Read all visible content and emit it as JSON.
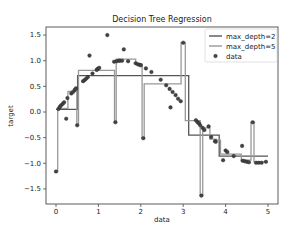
{
  "chart_data": {
    "type": "line",
    "title": "Decision Tree Regression",
    "xlabel": "data",
    "ylabel": "target",
    "xlim": [
      -0.25,
      5.2
    ],
    "ylim": [
      -1.8,
      1.62
    ],
    "xticks": [
      0,
      1,
      2,
      3,
      4,
      5
    ],
    "yticks": [
      -1.5,
      -1.0,
      -0.5,
      0.0,
      0.5,
      1.0,
      1.5
    ],
    "xtick_labels": [
      "0",
      "1",
      "2",
      "3",
      "4",
      "5"
    ],
    "ytick_labels": [
      "−1.5",
      "−1.0",
      "−0.5",
      "0.0",
      "0.5",
      "1.0",
      "1.5"
    ],
    "grid": false,
    "legend_position": "upper right",
    "legend": [
      "max_depth=2",
      "max_depth=5",
      "data"
    ],
    "series": [
      {
        "name": "max_depth=2",
        "kind": "step",
        "color": "#555555",
        "points": [
          [
            0.0,
            0.05
          ],
          [
            0.51,
            0.05
          ],
          [
            0.51,
            0.71
          ],
          [
            3.13,
            0.71
          ],
          [
            3.13,
            -0.45
          ],
          [
            3.85,
            -0.45
          ],
          [
            3.85,
            -0.86
          ],
          [
            5.0,
            -0.86
          ]
        ]
      },
      {
        "name": "max_depth=5",
        "kind": "step",
        "color": "#999999",
        "points": [
          [
            0.0,
            -1.16
          ],
          [
            0.04,
            -1.16
          ],
          [
            0.04,
            0.07
          ],
          [
            0.28,
            0.07
          ],
          [
            0.28,
            0.4
          ],
          [
            0.44,
            0.4
          ],
          [
            0.44,
            0.41
          ],
          [
            0.49,
            0.41
          ],
          [
            0.49,
            -0.26
          ],
          [
            0.53,
            -0.26
          ],
          [
            0.53,
            0.81
          ],
          [
            1.38,
            0.81
          ],
          [
            1.38,
            -0.2
          ],
          [
            1.42,
            -0.2
          ],
          [
            1.42,
            1.03
          ],
          [
            1.88,
            1.03
          ],
          [
            1.88,
            0.94
          ],
          [
            2.03,
            0.94
          ],
          [
            2.03,
            -0.51
          ],
          [
            2.08,
            -0.51
          ],
          [
            2.08,
            0.55
          ],
          [
            2.95,
            0.55
          ],
          [
            2.95,
            1.35
          ],
          [
            3.05,
            1.35
          ],
          [
            3.05,
            -0.17
          ],
          [
            3.4,
            -0.17
          ],
          [
            3.4,
            -1.63
          ],
          [
            3.46,
            -1.63
          ],
          [
            3.46,
            -0.31
          ],
          [
            3.63,
            -0.31
          ],
          [
            3.63,
            -0.53
          ],
          [
            3.78,
            -0.53
          ],
          [
            3.78,
            -0.55
          ],
          [
            3.88,
            -0.55
          ],
          [
            3.88,
            -0.82
          ],
          [
            4.37,
            -0.82
          ],
          [
            4.37,
            -0.94
          ],
          [
            4.6,
            -0.94
          ],
          [
            4.6,
            -0.2
          ],
          [
            4.67,
            -0.2
          ],
          [
            4.67,
            -0.97
          ],
          [
            5.0,
            -0.97
          ]
        ]
      },
      {
        "name": "data",
        "kind": "scatter",
        "color": "#444444",
        "points": [
          [
            0.0,
            -1.16
          ],
          [
            0.06,
            0.06
          ],
          [
            0.09,
            0.1
          ],
          [
            0.12,
            0.13
          ],
          [
            0.16,
            0.16
          ],
          [
            0.19,
            0.19
          ],
          [
            0.24,
            -0.13
          ],
          [
            0.27,
            0.27
          ],
          [
            0.36,
            0.36
          ],
          [
            0.4,
            0.39
          ],
          [
            0.44,
            0.43
          ],
          [
            0.47,
            0.46
          ],
          [
            0.5,
            -0.26
          ],
          [
            0.64,
            0.6
          ],
          [
            0.67,
            0.62
          ],
          [
            0.71,
            0.65
          ],
          [
            0.75,
            0.68
          ],
          [
            0.79,
            1.1
          ],
          [
            0.86,
            0.75
          ],
          [
            0.96,
            0.82
          ],
          [
            0.98,
            0.84
          ],
          [
            1.02,
            0.86
          ],
          [
            1.21,
            1.5
          ],
          [
            1.37,
            0.98
          ],
          [
            1.4,
            -0.2
          ],
          [
            1.43,
            0.99
          ],
          [
            1.48,
            1.0
          ],
          [
            1.51,
            1.0
          ],
          [
            1.56,
            1.0
          ],
          [
            1.6,
            1.22
          ],
          [
            1.7,
            0.99
          ],
          [
            1.88,
            0.95
          ],
          [
            1.93,
            0.93
          ],
          [
            1.97,
            0.92
          ],
          [
            2.0,
            0.91
          ],
          [
            2.06,
            -0.51
          ],
          [
            2.12,
            0.85
          ],
          [
            2.25,
            0.78
          ],
          [
            2.47,
            0.63
          ],
          [
            2.6,
            0.52
          ],
          [
            2.68,
            0.45
          ],
          [
            2.7,
            0.09
          ],
          [
            2.75,
            0.39
          ],
          [
            2.82,
            0.33
          ],
          [
            2.88,
            0.26
          ],
          [
            2.94,
            0.21
          ],
          [
            3.0,
            1.35
          ],
          [
            3.3,
            -0.16
          ],
          [
            3.34,
            -0.2
          ],
          [
            3.37,
            -0.22
          ],
          [
            3.4,
            -0.26
          ],
          [
            3.43,
            -1.63
          ],
          [
            3.46,
            -0.31
          ],
          [
            3.5,
            -0.35
          ],
          [
            3.6,
            -0.28
          ],
          [
            3.66,
            -0.49
          ],
          [
            3.75,
            -0.57
          ],
          [
            3.77,
            -0.58
          ],
          [
            3.94,
            -0.94
          ],
          [
            4.0,
            -0.75
          ],
          [
            4.04,
            -0.78
          ],
          [
            4.19,
            -0.86
          ],
          [
            4.39,
            -0.66
          ],
          [
            4.4,
            -0.95
          ],
          [
            4.45,
            -0.96
          ],
          [
            4.5,
            -0.97
          ],
          [
            4.55,
            -0.98
          ],
          [
            4.64,
            -0.2
          ],
          [
            4.72,
            -0.99
          ],
          [
            4.78,
            -0.99
          ],
          [
            4.85,
            -0.99
          ],
          [
            4.95,
            -0.97
          ]
        ]
      }
    ]
  }
}
